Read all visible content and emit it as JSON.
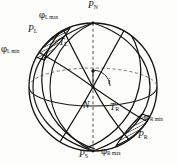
{
  "figure": {
    "kind": "celestial-sphere-diagram",
    "background_color": "#fdfdfb",
    "line_color": "#1a1a1a",
    "dashed_color": "#555555"
  },
  "labels": {
    "pole_north": {
      "base": "P",
      "sub": "N"
    },
    "pole_south": {
      "base": "P",
      "sub": "S"
    },
    "node": {
      "base": "N",
      "sub": ""
    },
    "inclination": {
      "base": "i",
      "sub": ""
    },
    "pole_left": {
      "base": "P",
      "sub": "L"
    },
    "pole_right": {
      "base": "P",
      "sub": "R"
    },
    "terminator_left": {
      "base": "T",
      "sub": "L"
    },
    "terminator_right": {
      "base": "T",
      "sub": "R"
    },
    "phi_l_max": {
      "greek": "φ",
      "sub": "L max"
    },
    "phi_l_min": {
      "greek": "φ",
      "sub": "L min"
    },
    "phi_r_max": {
      "greek": "φ",
      "sub": "R max"
    },
    "phi_r_min": {
      "greek": "φ",
      "sub": "R min"
    }
  },
  "geometry": {
    "sphere_center": [
      93,
      87
    ],
    "sphere_radius_x": 64,
    "sphere_radius_y": 64,
    "equator_ry": 19,
    "axis_top": [
      93,
      23
    ],
    "axis_bottom": [
      93,
      151
    ]
  }
}
